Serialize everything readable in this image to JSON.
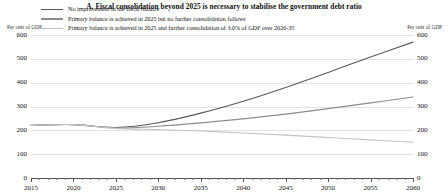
{
  "chart_data": {
    "type": "line",
    "title": "A. Fiscal consolidation beyond 2025 is necessary to stabilise the government debt ratio",
    "xlabel": "",
    "ylabel": "Per cent of GDP",
    "ylabel_right": "Per cent of GDP",
    "xlim": [
      2015,
      2060
    ],
    "ylim": [
      0,
      600
    ],
    "ytick_labels": [
      "600",
      "500",
      "400",
      "300",
      "200",
      "100",
      "0"
    ],
    "ytick_values": [
      600,
      500,
      400,
      300,
      200,
      100,
      0
    ],
    "xtick_labels": [
      "2015",
      "2020",
      "2025",
      "2030",
      "2035",
      "2040",
      "2045",
      "2050",
      "2055",
      "2060"
    ],
    "xtick_values": [
      2015,
      2020,
      2025,
      2030,
      2035,
      2040,
      2045,
      2050,
      2055,
      2060
    ],
    "minor_tick_interval": 1,
    "grid": "horizontal",
    "legend_position": "inside-upper-left",
    "x": [
      2015,
      2020,
      2025,
      2030,
      2035,
      2040,
      2045,
      2050,
      2055,
      2060
    ],
    "series": [
      {
        "name": "No improvement in the fiscal balance",
        "color": "#5a5a5a",
        "values": [
          221,
          224,
          212,
          232,
          272,
          322,
          380,
          443,
          508,
          570
        ]
      },
      {
        "name": "Primary balance is achieved in 2025 but no further consolidation follows",
        "color": "#8c8c8c",
        "values": [
          221,
          224,
          210,
          217,
          231,
          248,
          268,
          291,
          315,
          340
        ]
      },
      {
        "name": "Primary balance is achieved in 2025 and further consolidation of 3.0% of GDP over 2026-35",
        "color": "#c2c2c2",
        "values": [
          221,
          224,
          208,
          203,
          197,
          189,
          180,
          170,
          160,
          150
        ]
      }
    ]
  }
}
